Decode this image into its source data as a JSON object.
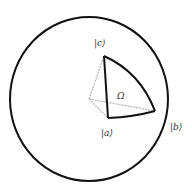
{
  "diagram": {
    "type": "bloch-sphere-geodesic-triangle",
    "sphere": {
      "cx": 89,
      "cy": 99,
      "rx": 79,
      "ry": 82,
      "stroke": "#111111"
    },
    "origin": {
      "x": 89,
      "y": 99
    },
    "vertices": {
      "a": {
        "x": 108,
        "y": 118,
        "label": "|a⟩",
        "label_x": 101,
        "label_y": 136
      },
      "b": {
        "x": 155,
        "y": 111,
        "label": "|b⟩",
        "label_x": 170,
        "label_y": 130
      },
      "c": {
        "x": 104,
        "y": 56,
        "label": "|c⟩",
        "label_x": 94,
        "label_y": 46
      }
    },
    "solid_angle_label": {
      "text": "Ω",
      "x": 117,
      "y": 99
    },
    "colors": {
      "edge": "#111111",
      "ray": "#b8b8b8"
    }
  }
}
